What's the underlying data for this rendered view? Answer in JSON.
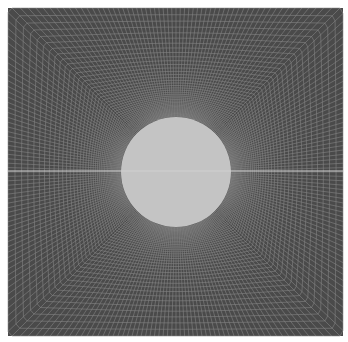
{
  "figure": {
    "type": "structured O-grid mesh around circular cylinder",
    "domain_box": {
      "x0": 8,
      "y0": 8,
      "x1": 343,
      "y1": 336
    },
    "circle": {
      "cx": 176,
      "cy": 172,
      "r": 55
    },
    "centerline_y": 171,
    "radial_lines": 240,
    "rings": 42,
    "colors": {
      "background": "#ffffff",
      "mesh_fill": "#4a4a4a",
      "mesh_line": "#8a8a8a",
      "circle_fill": "#c4c4c4",
      "centerline": "#d0d0d0"
    }
  },
  "caption": {
    "text": ""
  }
}
